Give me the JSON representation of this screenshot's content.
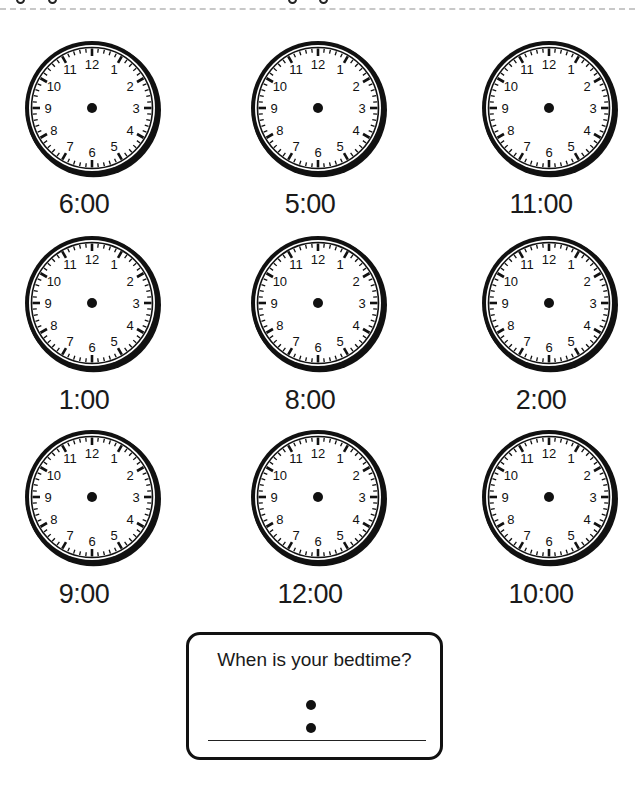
{
  "header": {
    "separator": "dashed-line",
    "descender_fragments_x": [
      20,
      52,
      292,
      323
    ]
  },
  "clock_face": {
    "numbers": [
      "12",
      "1",
      "2",
      "3",
      "4",
      "5",
      "6",
      "7",
      "8",
      "9",
      "10",
      "11"
    ],
    "ink_color": "#111111",
    "paper_color": "#ffffff"
  },
  "clocks": [
    {
      "label": "6:00",
      "cx": 92,
      "cy": 108
    },
    {
      "label": "5:00",
      "cx": 318,
      "cy": 108
    },
    {
      "label": "11:00",
      "cx": 549,
      "cy": 108
    },
    {
      "label": "1:00",
      "cx": 92,
      "cy": 303
    },
    {
      "label": "8:00",
      "cx": 318,
      "cy": 303
    },
    {
      "label": "2:00",
      "cx": 549,
      "cy": 303
    },
    {
      "label": "9:00",
      "cx": 92,
      "cy": 497
    },
    {
      "label": "12:00",
      "cx": 318,
      "cy": 497
    },
    {
      "label": "10:00",
      "cx": 549,
      "cy": 497
    }
  ],
  "label_offsets": {
    "row_label_y": [
      204,
      400,
      594
    ]
  },
  "bedtime": {
    "question": "When is your bedtime?",
    "answer_value": ""
  }
}
